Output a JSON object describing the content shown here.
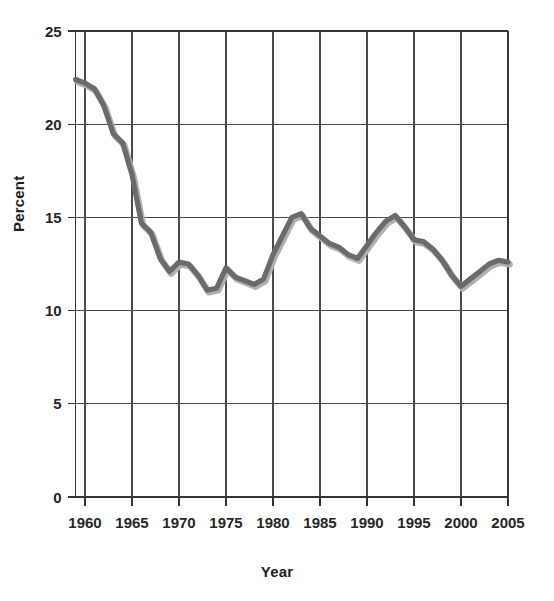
{
  "chart_data": {
    "type": "line",
    "title": "",
    "xlabel": "Year",
    "ylabel": "Percent",
    "xlim": [
      1959,
      2005
    ],
    "ylim": [
      0,
      25
    ],
    "grid": true,
    "legend": "none",
    "x_ticks": [
      "1960",
      "1965",
      "1970",
      "1975",
      "1980",
      "1985",
      "1990",
      "1995",
      "2000",
      "2005"
    ],
    "y_ticks": [
      "0",
      "5",
      "10",
      "15",
      "20",
      "25"
    ],
    "line_color": "#6b6b6b",
    "shadow_color": "#b0b0b0",
    "grid_color": "#4a4a4a",
    "series": [
      {
        "name": "Percent",
        "x": [
          1959,
          1960,
          1961,
          1962,
          1963,
          1964,
          1965,
          1966,
          1967,
          1968,
          1969,
          1970,
          1971,
          1972,
          1973,
          1974,
          1975,
          1976,
          1977,
          1978,
          1979,
          1980,
          1981,
          1982,
          1983,
          1984,
          1985,
          1986,
          1987,
          1988,
          1989,
          1990,
          1991,
          1992,
          1993,
          1994,
          1995,
          1996,
          1997,
          1998,
          1999,
          2000,
          2001,
          2002,
          2003,
          2004,
          2005
        ],
        "values": [
          22.4,
          22.2,
          21.9,
          21.0,
          19.5,
          19.0,
          17.3,
          14.7,
          14.2,
          12.8,
          12.1,
          12.6,
          12.5,
          11.9,
          11.1,
          11.2,
          12.3,
          11.8,
          11.6,
          11.4,
          11.7,
          13.0,
          14.0,
          15.0,
          15.2,
          14.4,
          14.0,
          13.6,
          13.4,
          13.0,
          12.8,
          13.5,
          14.2,
          14.8,
          15.1,
          14.5,
          13.8,
          13.7,
          13.3,
          12.7,
          11.9,
          11.3,
          11.7,
          12.1,
          12.5,
          12.7,
          12.6
        ]
      }
    ]
  },
  "axes": {
    "x_title": "Year",
    "y_title": "Percent"
  }
}
